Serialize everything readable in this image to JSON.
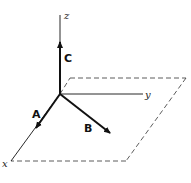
{
  "diagram": {
    "type": "3d-coordinate-vectors",
    "axes": {
      "x": {
        "label": "x"
      },
      "y": {
        "label": "y"
      },
      "z": {
        "label": "z"
      }
    },
    "vectors": [
      {
        "name": "A",
        "direction": "along x-axis"
      },
      {
        "name": "B",
        "direction": "in xy-plane, between x and y"
      },
      {
        "name": "C",
        "direction": "along z-axis"
      }
    ],
    "plane": {
      "style": "dashed",
      "description": "xy-plane parallelogram"
    },
    "colors": {
      "stroke": "#1a1a1a",
      "background": "#ffffff"
    }
  }
}
